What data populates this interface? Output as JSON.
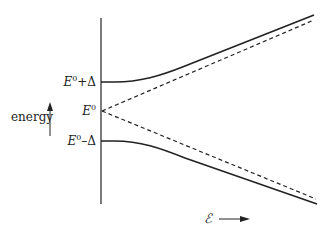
{
  "diagram": {
    "type": "energy-level-diagram",
    "y_axis_label": "energy",
    "x_axis_label": "ℰ",
    "levels": {
      "upper": {
        "base": "E",
        "sup": "0",
        "suffix": "+Δ"
      },
      "middle": {
        "base": "E",
        "sup": "0",
        "suffix": ""
      },
      "lower": {
        "base": "E",
        "sup": "0",
        "suffix": "–Δ"
      }
    },
    "curves": [
      {
        "name": "upper-solid",
        "style": "solid",
        "description": "E0+Δ rising hyperbolically"
      },
      {
        "name": "upper-dashed",
        "style": "dashed",
        "description": "E0 linear asymptote upward"
      },
      {
        "name": "lower-dashed",
        "style": "dashed",
        "description": "E0 linear asymptote downward"
      },
      {
        "name": "lower-solid",
        "style": "solid",
        "description": "E0−Δ falling hyperbolically"
      }
    ],
    "colors": {
      "line": "#222222",
      "background": "#ffffff"
    }
  }
}
